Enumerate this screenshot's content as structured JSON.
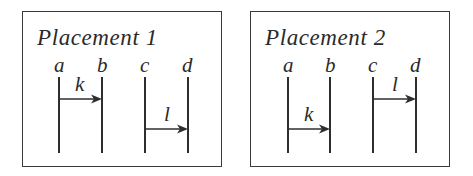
{
  "figure": {
    "panels": [
      {
        "title": "Placement 1",
        "lifelines": [
          {
            "label": "a",
            "x": 36
          },
          {
            "label": "b",
            "x": 79
          },
          {
            "label": "c",
            "x": 122
          },
          {
            "label": "d",
            "x": 165
          }
        ],
        "arrows": [
          {
            "label": "k",
            "from": "a",
            "to": "b",
            "order": "upper"
          },
          {
            "label": "l",
            "from": "c",
            "to": "d",
            "order": "lower"
          }
        ]
      },
      {
        "title": "Placement 2",
        "lifelines": [
          {
            "label": "a",
            "x": 37
          },
          {
            "label": "b",
            "x": 79
          },
          {
            "label": "c",
            "x": 122
          },
          {
            "label": "d",
            "x": 165
          }
        ],
        "arrows": [
          {
            "label": "k",
            "from": "a",
            "to": "b",
            "order": "lower"
          },
          {
            "label": "l",
            "from": "c",
            "to": "d",
            "order": "upper"
          }
        ]
      }
    ],
    "colors": {
      "ink": "#2e2e2e",
      "border": "#3a3a3a",
      "background": "#ffffff"
    }
  }
}
